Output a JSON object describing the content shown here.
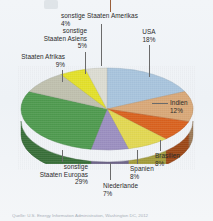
{
  "figure": {
    "background_color": "#eef2f6",
    "source_note": "Quelle: U.S. Energy Information Administration, Washington DC, 2012"
  },
  "chart_data": {
    "type": "pie",
    "title": "",
    "xlabel": "",
    "ylabel": "",
    "legend_position": "none",
    "grid": false,
    "units": "percent",
    "categories": [
      "USA",
      "Indien",
      "Brasilien",
      "Spanien",
      "Niederlande",
      "sonstige Staaten Europas",
      "Staaten Afrikas",
      "sonstige Staaten Asiens",
      "sonstige Staaten Amerikas"
    ],
    "values": [
      18,
      12,
      8,
      8,
      7,
      29,
      9,
      5,
      4
    ],
    "colors": [
      "#a8c4dd",
      "#d9a878",
      "#d9621f",
      "#e2d852",
      "#9b8fc0",
      "#4f9a4f",
      "#bfc0ae",
      "#e3e02a",
      "#dcdcd2"
    ],
    "slices": [
      {
        "label": "USA",
        "value": 18,
        "value_text": "18%",
        "color": "#a8c4dd"
      },
      {
        "label": "Indien",
        "value": 12,
        "value_text": "12%",
        "color": "#d9a878"
      },
      {
        "label": "Brasilien",
        "value": 8,
        "value_text": "8%",
        "color": "#d9621f"
      },
      {
        "label": "Spanien",
        "value": 8,
        "value_text": "8%",
        "color": "#e2d852"
      },
      {
        "label": "Niederlande",
        "value": 7,
        "value_text": "7%",
        "color": "#9b8fc0"
      },
      {
        "label": "sonstige Staaten Europas",
        "value": 29,
        "value_text": "29%",
        "color": "#4f9a4f"
      },
      {
        "label": "Staaten Afrikas",
        "value": 9,
        "value_text": "9%",
        "color": "#bfc0ae"
      },
      {
        "label": "sonstige Staaten Asiens",
        "value": 5,
        "value_text": "5%",
        "color": "#e3e02a"
      },
      {
        "label": "sonstige Staaten Amerikas",
        "value": 4,
        "value_text": "4%",
        "color": "#dcdcd2"
      }
    ]
  },
  "labels": {
    "amerikas": {
      "line1": "sonstige Staaten Amerikas",
      "pct": "4%"
    },
    "usa": {
      "line1": "USA",
      "pct": "18%"
    },
    "asiens": {
      "line1": "sonstige",
      "line2": "Staaten Asiens",
      "pct": "5%"
    },
    "afrikas": {
      "line1": "Staaten Afrikas",
      "pct": "9%"
    },
    "indien": {
      "line1": "Indien",
      "pct": "12%"
    },
    "brasilien": {
      "line1": "Brasilien",
      "pct": "8%"
    },
    "spanien": {
      "line1": "Spanien",
      "pct": "8%"
    },
    "niederlande": {
      "line1": "Niederlande",
      "pct": "7%"
    },
    "europas": {
      "line1": "sonstige",
      "line2": "Staaten Europas",
      "pct": "29%"
    }
  }
}
